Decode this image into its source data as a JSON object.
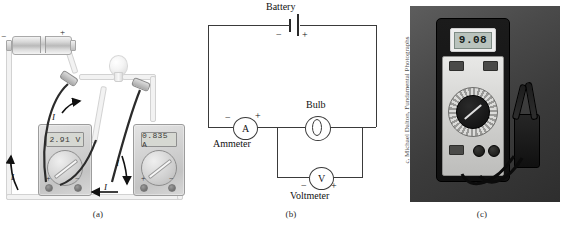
{
  "figure": {
    "panels": [
      {
        "id": "a",
        "caption": "(a)"
      },
      {
        "id": "b",
        "caption": "(b)"
      },
      {
        "id": "c",
        "caption": "(c)"
      }
    ]
  },
  "panel_a": {
    "caption": "(a)",
    "battery": {
      "minus": "−",
      "plus": "+"
    },
    "voltmeter": {
      "display": "2.91 V",
      "terminal_plus": "+",
      "terminal_minus": "−"
    },
    "ammeter": {
      "display": "0.835 A",
      "terminal_plus": "+",
      "terminal_minus": "−"
    },
    "current_labels": [
      "I",
      "I",
      "I",
      "I"
    ],
    "components": [
      "battery",
      "bulb",
      "voltmeter",
      "ammeter",
      "probes",
      "wires"
    ]
  },
  "panel_b": {
    "caption": "(b)",
    "battery_label": "Battery",
    "battery_minus": "−",
    "battery_plus": "+",
    "bulb_label": "Bulb",
    "ammeter_label": "Ammeter",
    "ammeter_symbol": "A",
    "ammeter_minus": "−",
    "ammeter_plus": "+",
    "voltmeter_label": "Voltmeter",
    "voltmeter_symbol": "V",
    "voltmeter_minus": "−",
    "voltmeter_plus": "+"
  },
  "panel_c": {
    "caption": "(c)",
    "display_value": "9.08",
    "credit": "c, Michael Dalton, Fundamental Photographs"
  },
  "colors": {
    "page_background": "#ffffff",
    "diagram_line": "#3a3a3a",
    "text": "#111111",
    "photo_background": "#3b3b3b",
    "lcd": "#b9c3bd"
  }
}
